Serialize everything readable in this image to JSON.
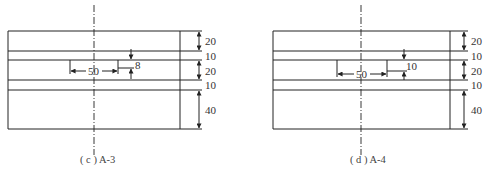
{
  "diagrams": [
    {
      "id": "c",
      "caption": "( c ) A-3",
      "layer_labels": [
        "20",
        "10",
        "20",
        "10",
        "40"
      ],
      "inner_width_label": "50",
      "inner_depth_label": "8"
    },
    {
      "id": "d",
      "caption": "( d ) A-4",
      "layer_labels": [
        "20",
        "10",
        "20",
        "10",
        "40"
      ],
      "inner_width_label": "50",
      "inner_depth_label": "10"
    }
  ],
  "colors": {
    "line": "#222222",
    "text": "#333333"
  }
}
